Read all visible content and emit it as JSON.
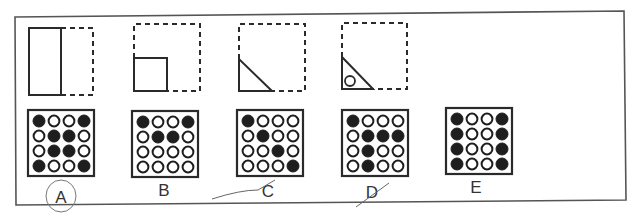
{
  "puzzle": {
    "sequence": [
      {
        "id": "fig1",
        "description": "solid tall rectangle (left half) with dashed outline completing square"
      },
      {
        "id": "fig2",
        "description": "dashed square with solid small square in lower-left corner"
      },
      {
        "id": "fig3",
        "description": "dashed square with solid right triangle in lower-left corner"
      },
      {
        "id": "fig4",
        "description": "dashed square with solid right triangle and small circle in lower-left corner"
      }
    ],
    "options": [
      {
        "label": "A",
        "grid": [
          [
            1,
            0,
            0,
            1
          ],
          [
            0,
            1,
            1,
            0
          ],
          [
            0,
            1,
            1,
            0
          ],
          [
            1,
            0,
            0,
            1
          ]
        ],
        "annotation": "circled"
      },
      {
        "label": "B",
        "grid": [
          [
            1,
            0,
            0,
            1
          ],
          [
            0,
            1,
            1,
            0
          ],
          [
            0,
            0,
            0,
            0
          ],
          [
            0,
            0,
            0,
            0
          ]
        ],
        "annotation": ""
      },
      {
        "label": "C",
        "grid": [
          [
            1,
            0,
            0,
            0
          ],
          [
            0,
            1,
            0,
            0
          ],
          [
            0,
            0,
            1,
            0
          ],
          [
            0,
            0,
            0,
            1
          ]
        ],
        "annotation": "crossed-out"
      },
      {
        "label": "D",
        "grid": [
          [
            1,
            0,
            0,
            0
          ],
          [
            0,
            1,
            1,
            1
          ],
          [
            0,
            1,
            0,
            0
          ],
          [
            0,
            1,
            0,
            0
          ]
        ],
        "annotation": "crossed-out"
      },
      {
        "label": "E",
        "grid": [
          [
            1,
            0,
            0,
            1
          ],
          [
            1,
            0,
            0,
            1
          ],
          [
            1,
            0,
            0,
            1
          ],
          [
            1,
            0,
            0,
            1
          ]
        ],
        "annotation": ""
      }
    ]
  },
  "colors": {
    "ink": "#2a2a2a",
    "frame": "#555555",
    "pencil": "#6a6a6a"
  }
}
